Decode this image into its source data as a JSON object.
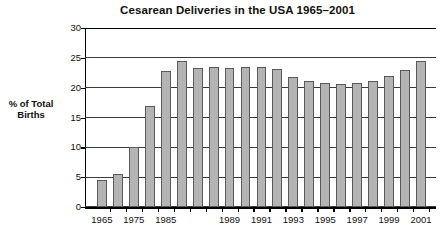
{
  "chart_data": {
    "type": "bar",
    "title": "Cesarean Deliveries in the USA 1965–2001",
    "xlabel": "",
    "ylabel": "% of Total Births",
    "ylim": [
      0,
      30
    ],
    "yticks": [
      0,
      5,
      10,
      15,
      20,
      25,
      30
    ],
    "ytick_labels": [
      "0",
      "5",
      "10",
      "15",
      "20",
      "25",
      "30"
    ],
    "grid": true,
    "legend": null,
    "categories": [
      "1965",
      "1970",
      "1975",
      "1980",
      "1985",
      "1986",
      "1987",
      "1988",
      "1989",
      "1990",
      "1991",
      "1992",
      "1993",
      "1994",
      "1995",
      "1996",
      "1997",
      "1998",
      "1999",
      "2000",
      "2001"
    ],
    "values": [
      4.5,
      5.5,
      10.0,
      16.9,
      22.8,
      24.4,
      23.3,
      23.5,
      23.3,
      23.5,
      23.5,
      23.2,
      21.8,
      21.2,
      20.8,
      20.7,
      20.8,
      21.2,
      22.0,
      22.9,
      24.4
    ],
    "tick_label_years": [
      "1965",
      "1975",
      "1985",
      "1989",
      "1991",
      "1993",
      "1995",
      "1997",
      "1999",
      "2001"
    ],
    "bar_color": "#b4b4b4",
    "bar_edge_color": "#5a5a5a",
    "axis_color": "#000000",
    "grid_color": "#3a3a3a",
    "background": "#ffffff"
  }
}
